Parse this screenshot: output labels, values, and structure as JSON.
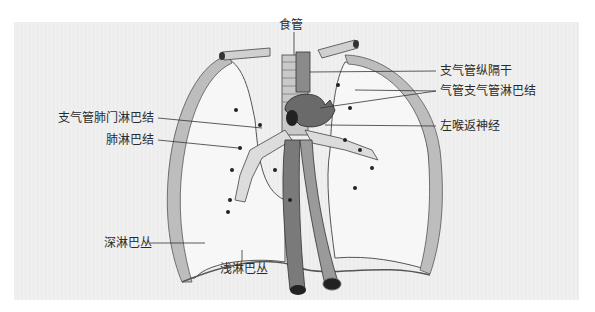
{
  "figure": {
    "background_color": "#ededed",
    "labels": {
      "esophagus": "食管",
      "bronchomediastinal_trunk": "支气管纵隔干",
      "tracheobronchial_lymph_nodes": "气管支气管淋巴结",
      "bronchopulmonary_hilar_lymph_nodes": "支气管肺门淋巴结",
      "pulmonary_lymph_nodes": "肺淋巴结",
      "left_recurrent_laryngeal_nerve": "左喉返神经",
      "deep_lymphatic_plexus": "深淋巴丛",
      "superficial_lymphatic_plexus": "浅淋巴丛"
    }
  }
}
